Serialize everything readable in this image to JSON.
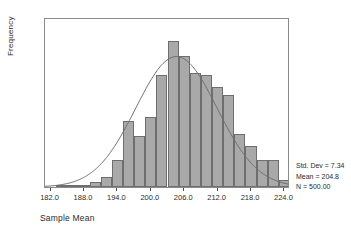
{
  "chart_data": {
    "type": "bar",
    "title": "",
    "xlabel": "Sample Mean",
    "ylabel": "Frequency",
    "xlim": [
      181.0,
      225.0
    ],
    "ylim": [
      0,
      70
    ],
    "grid": false,
    "bin_width": 2.0,
    "categories": [
      "182.0",
      "184.0",
      "186.0",
      "188.0",
      "190.0",
      "192.0",
      "194.0",
      "196.0",
      "198.0",
      "200.0",
      "202.0",
      "204.0",
      "206.0",
      "208.0",
      "210.0",
      "212.0",
      "214.0",
      "216.0",
      "218.0",
      "220.0",
      "222.0",
      "224.0"
    ],
    "bin_centers": [
      182,
      184,
      186,
      188,
      190,
      192,
      194,
      196,
      198,
      200,
      202,
      204,
      206,
      208,
      210,
      212,
      214,
      216,
      218,
      220,
      222,
      224
    ],
    "values": [
      0,
      1,
      1,
      1,
      2,
      4,
      11,
      27,
      21,
      29,
      46,
      60,
      54,
      47,
      46,
      41,
      38,
      22,
      17,
      11,
      11,
      3
    ],
    "xticks": [
      "182.0",
      "188.0",
      "194.0",
      "200.0",
      "206.0",
      "212.0",
      "218.0",
      "224.0"
    ],
    "xtick_values": [
      182.0,
      188.0,
      194.0,
      200.0,
      206.0,
      212.0,
      218.0,
      224.0
    ],
    "yticks": [
      "0",
      "10",
      "20",
      "30",
      "40",
      "50",
      "60",
      "70"
    ],
    "ytick_values": [
      0,
      10,
      20,
      30,
      40,
      50,
      60,
      70
    ],
    "overlay": {
      "type": "normal-curve",
      "mean": 204.8,
      "std_dev": 7.34,
      "n": 500,
      "peak_value": 54.4
    },
    "bar_color": "#a9a9a9",
    "bar_border_color": "#6e6e6e",
    "curve_color": "#6e6e6e",
    "axis_color": "#4a4a4a",
    "frame_color": "#8a8a8a"
  },
  "stats": {
    "std_dev": "Std. Dev = 7.34",
    "mean": "Mean = 204.8",
    "n": "N = 500.00"
  }
}
